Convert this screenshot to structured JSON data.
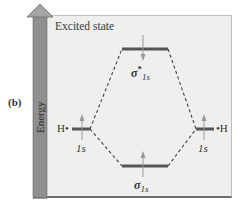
{
  "figure": {
    "part_label": "(b)",
    "panel_title": "Excited state",
    "axis": {
      "label": "Energy",
      "direction": "up",
      "color": "#8f8f8f"
    },
    "colors": {
      "panel_background": "#efefee",
      "level_line": "#555555",
      "electron_arrow": "#9a9a9a",
      "dashed_connector": "#444444",
      "text": "#333333"
    },
    "levels": [
      {
        "id": "h-left-1s",
        "atom_label": "H•",
        "orbital_label": "1s",
        "electron": "up",
        "position": "left-middle"
      },
      {
        "id": "sigma-star-1s",
        "orbital_symbol": "σ",
        "superscript": "*",
        "subscript": "1s",
        "electron": "down",
        "position": "center-top"
      },
      {
        "id": "sigma-1s",
        "orbital_symbol": "σ",
        "subscript": "1s",
        "electron": "up",
        "position": "center-bottom"
      },
      {
        "id": "h-right-1s",
        "atom_label": "•H",
        "orbital_label": "1s",
        "electron": "up",
        "position": "right-middle"
      }
    ]
  }
}
